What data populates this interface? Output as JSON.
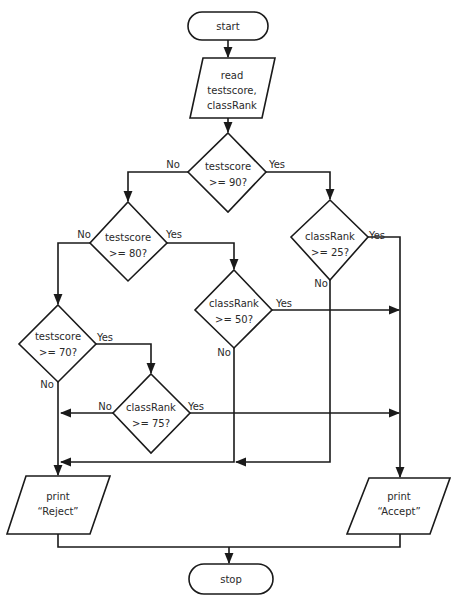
{
  "diagram": {
    "type": "flowchart",
    "nodes": {
      "start": {
        "shape": "terminator",
        "label": "start"
      },
      "read": {
        "shape": "io",
        "lines": [
          "read",
          "testscore,",
          "classRank"
        ]
      },
      "d_score90": {
        "shape": "decision",
        "lines": [
          "testscore",
          ">= 90?"
        ]
      },
      "d_score80": {
        "shape": "decision",
        "lines": [
          "testscore",
          ">= 80?"
        ]
      },
      "d_rank25": {
        "shape": "decision",
        "lines": [
          "classRank",
          ">= 25?"
        ]
      },
      "d_rank50": {
        "shape": "decision",
        "lines": [
          "classRank",
          ">= 50?"
        ]
      },
      "d_score70": {
        "shape": "decision",
        "lines": [
          "testscore",
          ">= 70?"
        ]
      },
      "d_rank75": {
        "shape": "decision",
        "lines": [
          "classRank",
          ">= 75?"
        ]
      },
      "reject": {
        "shape": "io",
        "lines": [
          "print",
          "“Reject”"
        ]
      },
      "accept": {
        "shape": "io",
        "lines": [
          "print",
          "“Accept”"
        ]
      },
      "stop": {
        "shape": "terminator",
        "label": "stop"
      }
    },
    "edge_labels": {
      "yes": "Yes",
      "no": "No"
    },
    "edges": [
      {
        "from": "start",
        "to": "read"
      },
      {
        "from": "read",
        "to": "d_score90"
      },
      {
        "from": "d_score90",
        "to": "d_score80",
        "label": "No"
      },
      {
        "from": "d_score90",
        "to": "d_rank25",
        "label": "Yes"
      },
      {
        "from": "d_score80",
        "to": "d_score70",
        "label": "No"
      },
      {
        "from": "d_score80",
        "to": "d_rank50",
        "label": "Yes"
      },
      {
        "from": "d_rank25",
        "to": "accept",
        "label": "Yes"
      },
      {
        "from": "d_rank25",
        "to": "reject",
        "label": "No"
      },
      {
        "from": "d_rank50",
        "to": "accept",
        "label": "Yes"
      },
      {
        "from": "d_rank50",
        "to": "reject",
        "label": "No"
      },
      {
        "from": "d_score70",
        "to": "d_rank75",
        "label": "Yes"
      },
      {
        "from": "d_score70",
        "to": "reject",
        "label": "No"
      },
      {
        "from": "d_rank75",
        "to": "accept",
        "label": "Yes"
      },
      {
        "from": "d_rank75",
        "to": "reject",
        "label": "No"
      },
      {
        "from": "reject",
        "to": "stop"
      },
      {
        "from": "accept",
        "to": "stop"
      }
    ]
  }
}
